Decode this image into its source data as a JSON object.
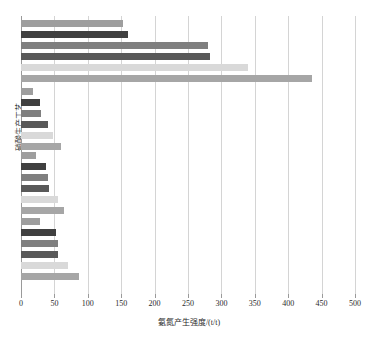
{
  "chart_data": {
    "type": "bar",
    "orientation": "horizontal",
    "title": "",
    "xlabel": "氨氮产生强度/(t/t)",
    "ylabel": "硝酸生产工艺",
    "xlim": [
      0,
      500
    ],
    "xticks": [
      0,
      50,
      100,
      150,
      200,
      250,
      300,
      350,
      400,
      450,
      500
    ],
    "grid": "vertical",
    "legend": "none",
    "categories": [
      "工艺1",
      "工艺2",
      "工艺3",
      "工艺4"
    ],
    "series": [
      {
        "name": "系列1",
        "color": "#9e9e9e",
        "values": [
          152,
          18,
          22,
          28
        ]
      },
      {
        "name": "系列2",
        "color": "#404040",
        "values": [
          160,
          28,
          38,
          52
        ]
      },
      {
        "name": "系列3",
        "color": "#7f7f7f",
        "values": [
          280,
          30,
          40,
          55
        ]
      },
      {
        "name": "系列4",
        "color": "#595959",
        "values": [
          283,
          40,
          42,
          56
        ]
      },
      {
        "name": "系列5",
        "color": "#d9d9d9",
        "values": [
          340,
          48,
          55,
          70
        ]
      },
      {
        "name": "系列6",
        "color": "#a6a6a6",
        "values": [
          435,
          60,
          65,
          87
        ]
      }
    ]
  },
  "axis": {
    "x_tick_labels": [
      "0",
      "50",
      "100",
      "150",
      "200",
      "250",
      "300",
      "350",
      "400",
      "450",
      "500"
    ],
    "x_title": "氨氮产生强度/(t/t)",
    "y_title": "硝酸生产工艺"
  }
}
